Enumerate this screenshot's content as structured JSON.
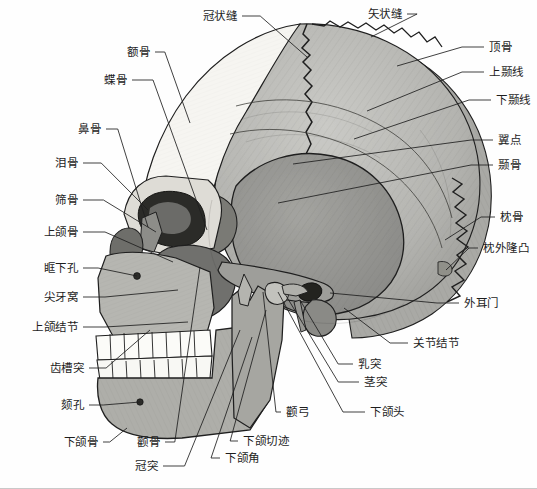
{
  "figure": {
    "orientation": "lateral",
    "background_color": "#fefefe",
    "line_color": "#1d1d1d"
  },
  "palette": {
    "frontal_white": "#f7f6f2",
    "parietal_light": "#bcbcb8",
    "temporal_mid": "#9a9a97",
    "occipital_mid": "#a8a8a4",
    "sphenoid_dark": "#72726f",
    "zygomatic_dark": "#6e6e6b",
    "maxilla_gray": "#b2b2ad",
    "mandible_gray": "#adada8",
    "teeth_white": "#fbfbf8",
    "outline": "#1f1f1f",
    "hatch": "#4a4a47"
  },
  "labels": [
    {
      "id": "coronal-suture",
      "text": "冠状缝",
      "side": "right",
      "x": 237,
      "y": 16,
      "tip_x": 307,
      "tip_y": 57
    },
    {
      "id": "sagittal-suture",
      "text": "矢状缝",
      "side": "right",
      "x": 402,
      "y": 14,
      "tip_x": 371,
      "tip_y": 37
    },
    {
      "id": "parietal-bone",
      "text": "顶骨",
      "side": "left",
      "x": 489,
      "y": 47,
      "tip_x": 397,
      "tip_y": 66
    },
    {
      "id": "superior-temporal-line",
      "text": "上颞线",
      "side": "left",
      "x": 489,
      "y": 72,
      "tip_x": 367,
      "tip_y": 111
    },
    {
      "id": "inferior-temporal-line",
      "text": "下颞线",
      "side": "left",
      "x": 496,
      "y": 100,
      "tip_x": 354,
      "tip_y": 139
    },
    {
      "id": "pterion",
      "text": "翼点",
      "side": "left",
      "x": 498,
      "y": 140,
      "tip_x": 293,
      "tip_y": 164
    },
    {
      "id": "temporal-bone",
      "text": "颞骨",
      "side": "left",
      "x": 498,
      "y": 165,
      "tip_x": 278,
      "tip_y": 203
    },
    {
      "id": "occipital-bone",
      "text": "枕骨",
      "side": "left",
      "x": 500,
      "y": 217,
      "tip_x": 445,
      "tip_y": 240
    },
    {
      "id": "occipital-protuberance",
      "text": "枕外隆凸",
      "side": "left",
      "x": 483,
      "y": 248,
      "tip_x": 446,
      "tip_y": 270
    },
    {
      "id": "external-acoustic-meatus",
      "text": "外耳门",
      "side": "left",
      "x": 464,
      "y": 303,
      "tip_x": 330,
      "tip_y": 293
    },
    {
      "id": "articular-tubercle",
      "text": "关节结节",
      "side": "left",
      "x": 413,
      "y": 343,
      "tip_x": 344,
      "tip_y": 308
    },
    {
      "id": "frontal-bone",
      "text": "额骨",
      "side": "right",
      "x": 150,
      "y": 52,
      "tip_x": 190,
      "tip_y": 123
    },
    {
      "id": "sphenoid-bone",
      "text": "蝶骨",
      "side": "right",
      "x": 127,
      "y": 80,
      "tip_x": 207,
      "tip_y": 230
    },
    {
      "id": "nasal-bone",
      "text": "鼻骨",
      "side": "right",
      "x": 101,
      "y": 129,
      "tip_x": 148,
      "tip_y": 227
    },
    {
      "id": "lacrimal-bone",
      "text": "泪骨",
      "side": "right",
      "x": 78,
      "y": 163,
      "tip_x": 148,
      "tip_y": 210
    },
    {
      "id": "ethmoid-bone",
      "text": "筛骨",
      "side": "right",
      "x": 78,
      "y": 200,
      "tip_x": 156,
      "tip_y": 232
    },
    {
      "id": "maxilla",
      "text": "上颌骨",
      "side": "right",
      "x": 78,
      "y": 232,
      "tip_x": 173,
      "tip_y": 262
    },
    {
      "id": "infraorbital-foramen",
      "text": "眶下孔",
      "side": "right",
      "x": 78,
      "y": 268,
      "tip_x": 137,
      "tip_y": 276
    },
    {
      "id": "canine-fossa",
      "text": "尖牙窝",
      "side": "right",
      "x": 78,
      "y": 297,
      "tip_x": 178,
      "tip_y": 290
    },
    {
      "id": "maxillary-tuberosity",
      "text": "上颌结节",
      "side": "right",
      "x": 78,
      "y": 327,
      "tip_x": 188,
      "tip_y": 322
    },
    {
      "id": "alveolar-process",
      "text": "齿槽突",
      "side": "right",
      "x": 84,
      "y": 368,
      "tip_x": 150,
      "tip_y": 330
    },
    {
      "id": "mental-foramen",
      "text": "颏孔",
      "side": "right",
      "x": 84,
      "y": 405,
      "tip_x": 140,
      "tip_y": 402
    },
    {
      "id": "mandible",
      "text": "下颌骨",
      "side": "right",
      "x": 98,
      "y": 442,
      "tip_x": 127,
      "tip_y": 428
    },
    {
      "id": "zygomatic-bone",
      "text": "颧骨",
      "side": "right",
      "x": 160,
      "y": 442,
      "tip_x": 200,
      "tip_y": 267
    },
    {
      "id": "coronoid-process",
      "text": "冠突",
      "side": "right",
      "x": 158,
      "y": 466,
      "tip_x": 240,
      "tip_y": 330
    },
    {
      "id": "mandibular-angle",
      "text": "下颌角",
      "side": "left",
      "x": 225,
      "y": 458,
      "tip_x": 252,
      "tip_y": 337
    },
    {
      "id": "mandibular-notch",
      "text": "下颌切迹",
      "side": "left",
      "x": 243,
      "y": 441,
      "tip_x": 266,
      "tip_y": 310
    },
    {
      "id": "zygomatic-arch",
      "text": "颧弓",
      "side": "left",
      "x": 286,
      "y": 412,
      "tip_x": 263,
      "tip_y": 292
    },
    {
      "id": "mandibular-head",
      "text": "下颌头",
      "side": "left",
      "x": 370,
      "y": 412,
      "tip_x": 278,
      "tip_y": 292
    },
    {
      "id": "styloid-process",
      "text": "茎突",
      "side": "left",
      "x": 364,
      "y": 382,
      "tip_x": 285,
      "tip_y": 294
    },
    {
      "id": "mastoid-process",
      "text": "乳突",
      "side": "left",
      "x": 358,
      "y": 364,
      "tip_x": 300,
      "tip_y": 300
    }
  ]
}
